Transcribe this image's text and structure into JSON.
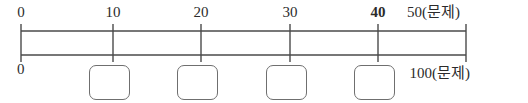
{
  "diagram": {
    "type": "dual-number-line",
    "unit_label": "(문제)",
    "stroke_color": "#4a4a4a",
    "box_stroke_color": "#6f6f6f",
    "background_color": "#ffffff",
    "axis_left_x": 21,
    "axis_right_x": 466,
    "top_line_y": 31,
    "bottom_line_y": 55,
    "tick_top_y": 24,
    "tick_bottom_y": 62
  },
  "top_axis": {
    "name": "top-number-line",
    "scale_max": 50,
    "ticks": [
      {
        "value": "0",
        "x": 21,
        "label": "0",
        "bold": false,
        "label_align": "center"
      },
      {
        "value": "10",
        "x": 113,
        "label": "10",
        "bold": false,
        "label_align": "center"
      },
      {
        "value": "20",
        "x": 201,
        "label": "20",
        "bold": false,
        "label_align": "center"
      },
      {
        "value": "30",
        "x": 290,
        "label": "30",
        "bold": false,
        "label_align": "center"
      },
      {
        "value": "40",
        "x": 378,
        "label": "40",
        "bold": true,
        "label_align": "center"
      },
      {
        "value": "50",
        "x": 466,
        "label": "50(문제)",
        "bold": false,
        "label_align": "right"
      }
    ]
  },
  "bottom_axis": {
    "name": "bottom-number-line",
    "scale_max": 100,
    "labels": [
      {
        "label": "0",
        "x": 21,
        "align": "left"
      },
      {
        "label": "100(문제)",
        "x": 466,
        "align": "right"
      }
    ]
  },
  "answer_boxes": [
    {
      "id": "box-1",
      "x": 89,
      "y": 65,
      "width": 41,
      "height": 35,
      "value": ""
    },
    {
      "id": "box-2",
      "x": 177,
      "y": 65,
      "width": 41,
      "height": 35,
      "value": ""
    },
    {
      "id": "box-3",
      "x": 266,
      "y": 65,
      "width": 41,
      "height": 35,
      "value": ""
    },
    {
      "id": "box-4",
      "x": 354,
      "y": 65,
      "width": 41,
      "height": 35,
      "value": ""
    }
  ]
}
